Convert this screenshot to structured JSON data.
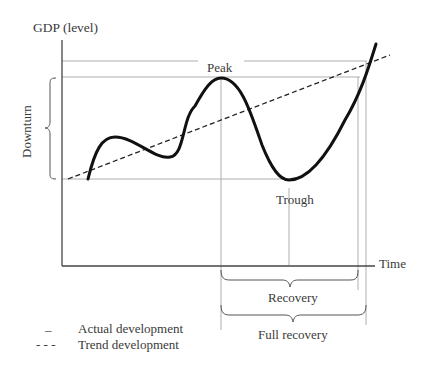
{
  "diagram": {
    "y_axis_label": "GDP (level)",
    "x_axis_label": "Time",
    "labels": {
      "peak": "Peak",
      "trough": "Trough",
      "downturn": "Downturn",
      "recovery": "Recovery",
      "full_recovery": "Full recovery"
    },
    "legend": [
      {
        "symbol": "–",
        "label": "Actual development"
      },
      {
        "symbol": "- - -",
        "label": "Trend development"
      }
    ],
    "colors": {
      "actual_line": "#111111",
      "trend_line": "#222222",
      "guide_lines": "#9a9a9a",
      "axis": "#444444"
    }
  }
}
